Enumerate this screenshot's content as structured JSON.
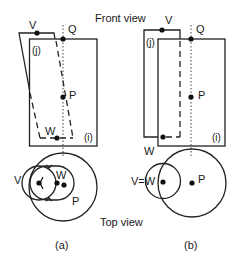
{
  "labels": {
    "front_view": "Front view",
    "top_view": "Top view"
  },
  "panel_a": {
    "caption": "(a)",
    "body_i": "(i)",
    "body_j": "(j)",
    "points": {
      "V": "V",
      "Q": "Q",
      "P": "P",
      "W": "W"
    },
    "top_view_points": {
      "V": "V",
      "W": "W",
      "P": "P"
    }
  },
  "panel_b": {
    "caption": "(b)",
    "body_i": "(i)",
    "body_j": "(j)",
    "points": {
      "V": "V",
      "Q": "Q",
      "P": "P",
      "W": "W"
    },
    "top_view_points": {
      "VW": "V=W",
      "P": "P"
    }
  }
}
